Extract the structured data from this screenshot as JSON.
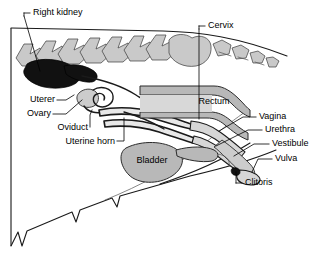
{
  "figure": {
    "background_color": "#ffffff",
    "line_color": "#000000",
    "bone_color": "#c9c9c9",
    "organ_color": "#b8b8b8",
    "kidney_color": "#111111"
  },
  "labels": {
    "right_kidney": "Right kidney",
    "cervix": "Cervix",
    "uterer": "Uterer",
    "ovary": "Ovary",
    "oviduct": "Oviduct",
    "uterine_horn": "Uterine horn",
    "rectum": "Rectum",
    "bladder": "Bladder",
    "vagina": "Vagina",
    "urethra": "Urethra",
    "vestibule": "Vestibule",
    "vulva": "Vulva",
    "clitoris": "Clitoris"
  }
}
